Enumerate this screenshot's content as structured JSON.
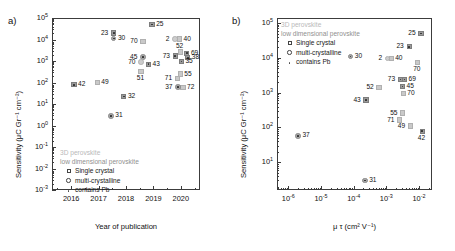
{
  "figure": {
    "panel_a_letter": "a)",
    "panel_b_letter": "b)"
  },
  "legend": {
    "head_3d": "3D perovskite",
    "head_lowdim": "low dimensional perovskite",
    "single_crystal": "Single crystal",
    "multi_crystalline": "multi-crystalline",
    "contains_pb": "contains Pb",
    "sym_square": "square-marker",
    "sym_circle": "circle-marker",
    "sym_dot": "dot-marker"
  },
  "panel_a": {
    "ylabel": "Sensitivity (μC Gr⁻¹ cm⁻²)",
    "xlabel": "Year of publication",
    "yticks": [
      "10⁻³",
      "10⁻²",
      "10⁻¹",
      "10⁰",
      "10¹",
      "10²",
      "10³",
      "10⁴",
      "10⁵"
    ],
    "xticks": [
      "2016",
      "2017",
      "2018",
      "2019",
      "2020"
    ],
    "xlim": [
      2015.3,
      2020.7
    ],
    "ylim_log": [
      -3,
      5
    ]
  },
  "panel_b": {
    "ylabel": "Sensitivity (μC Gr⁻¹ cm⁻²)",
    "xlabel": "μ τ (cm² V⁻¹)",
    "yticks": [
      "10¹",
      "10²",
      "10³",
      "10⁴",
      "10⁵"
    ],
    "xticks": [
      "10⁻⁶",
      "10⁻⁵",
      "10⁻⁴",
      "10⁻³",
      "10⁻²"
    ],
    "xlim_log": [
      -6.35,
      -1.6
    ],
    "ylim_log": [
      0.2,
      5.15
    ]
  },
  "chart_data": [
    {
      "type": "scatter",
      "panel": "a",
      "title": "",
      "xlabel": "Year of publication",
      "ylabel": "Sensitivity (μC Gr⁻¹ cm⁻²)",
      "xscale": "linear",
      "yscale": "log",
      "xlim": [
        2015.3,
        2020.7
      ],
      "ylim": [
        0.001,
        100000
      ],
      "grid": false,
      "legend_position": "lower-left",
      "points": [
        {
          "label": "25",
          "x": 2018.95,
          "y": 50000,
          "marker": "square-dot",
          "label_pos": "right"
        },
        {
          "label": "23",
          "x": 2017.55,
          "y": 20000,
          "marker": "square-dot",
          "label_pos": "left"
        },
        {
          "label": "30",
          "x": 2017.55,
          "y": 11000,
          "marker": "circle-dot",
          "label_pos": "right"
        },
        {
          "label": "70",
          "x": 2018.62,
          "y": 8000,
          "marker": "square",
          "label_pos": "left"
        },
        {
          "label": "2",
          "x": 2019.78,
          "y": 10500,
          "marker": "circle",
          "label_pos": "left"
        },
        {
          "label": "40",
          "x": 2019.95,
          "y": 10500,
          "marker": "square",
          "label_pos": "right"
        },
        {
          "label": "52",
          "x": 2019.98,
          "y": 2600,
          "marker": "square",
          "label_pos": "above"
        },
        {
          "label": "69",
          "x": 2020.22,
          "y": 2300,
          "marker": "square-dot",
          "label_pos": "right"
        },
        {
          "label": "73",
          "x": 2019.8,
          "y": 1700,
          "marker": "square-dot",
          "label_pos": "left"
        },
        {
          "label": "38",
          "x": 2020.25,
          "y": 1400,
          "marker": "square-dot",
          "label_pos": "right"
        },
        {
          "label": "35",
          "x": 2020.02,
          "y": 950,
          "marker": "square-dot",
          "label_pos": "right"
        },
        {
          "label": "45",
          "x": 2018.62,
          "y": 1500,
          "marker": "circle-dot",
          "label_pos": "left"
        },
        {
          "label": "70",
          "x": 2018.55,
          "y": 900,
          "marker": "circle",
          "label_pos": "left"
        },
        {
          "label": "43",
          "x": 2018.82,
          "y": 700,
          "marker": "square-dot",
          "label_pos": "right"
        },
        {
          "label": "51",
          "x": 2018.55,
          "y": 330,
          "marker": "square",
          "label_pos": "below"
        },
        {
          "label": "55",
          "x": 2019.98,
          "y": 250,
          "marker": "square",
          "label_pos": "right"
        },
        {
          "label": "71",
          "x": 2019.88,
          "y": 150,
          "marker": "square",
          "label_pos": "left"
        },
        {
          "label": "72",
          "x": 2020.08,
          "y": 60,
          "marker": "square",
          "label_pos": "right"
        },
        {
          "label": "37",
          "x": 2019.9,
          "y": 60,
          "marker": "circle-dot",
          "label_pos": "left"
        },
        {
          "label": "42",
          "x": 2016.1,
          "y": 78,
          "marker": "square-dot",
          "label_pos": "right"
        },
        {
          "label": "49",
          "x": 2016.95,
          "y": 100,
          "marker": "square",
          "label_pos": "right"
        },
        {
          "label": "32",
          "x": 2017.92,
          "y": 22,
          "marker": "square-dot",
          "label_pos": "right"
        },
        {
          "label": "31",
          "x": 2017.45,
          "y": 2.8,
          "marker": "circle-dot",
          "label_pos": "right"
        }
      ]
    },
    {
      "type": "scatter",
      "panel": "b",
      "title": "",
      "xlabel": "μ τ (cm² V⁻¹)",
      "ylabel": "Sensitivity (μC Gr⁻¹ cm⁻²)",
      "xscale": "log",
      "yscale": "log",
      "xlim": [
        4.5e-07,
        0.025
      ],
      "ylim": [
        1.6,
        140000
      ],
      "grid": false,
      "legend_position": "upper-left",
      "points": [
        {
          "label": "25",
          "x": 0.0115,
          "y": 50000,
          "marker": "square-dot",
          "label_pos": "left"
        },
        {
          "label": "23",
          "x": 0.005,
          "y": 21000,
          "marker": "square-dot",
          "label_pos": "left"
        },
        {
          "label": "30",
          "x": 8e-05,
          "y": 11000,
          "marker": "circle-dot",
          "label_pos": "right"
        },
        {
          "label": "2",
          "x": 0.0011,
          "y": 9500,
          "marker": "circle",
          "label_pos": "left"
        },
        {
          "label": "40",
          "x": 0.0014,
          "y": 9500,
          "marker": "square",
          "label_pos": "right"
        },
        {
          "label": "70",
          "x": 0.009,
          "y": 7500,
          "marker": "square",
          "label_pos": "below"
        },
        {
          "label": "73",
          "x": 0.0027,
          "y": 2400,
          "marker": "square-dot",
          "label_pos": "left"
        },
        {
          "label": "69",
          "x": 0.0036,
          "y": 2400,
          "marker": "square-dot",
          "label_pos": "right"
        },
        {
          "label": "45",
          "x": 0.0031,
          "y": 1500,
          "marker": "square-dot",
          "label_pos": "right"
        },
        {
          "label": "70",
          "x": 0.0033,
          "y": 950,
          "marker": "square",
          "label_pos": "right"
        },
        {
          "label": "52",
          "x": 0.0006,
          "y": 1400,
          "marker": "square",
          "label_pos": "left"
        },
        {
          "label": "43",
          "x": 0.00024,
          "y": 620,
          "marker": "square-dot",
          "label_pos": "left"
        },
        {
          "label": "55",
          "x": 0.0032,
          "y": 260,
          "marker": "square",
          "label_pos": "left"
        },
        {
          "label": "71",
          "x": 0.0026,
          "y": 165,
          "marker": "square",
          "label_pos": "left"
        },
        {
          "label": "49",
          "x": 0.0055,
          "y": 110,
          "marker": "square",
          "label_pos": "left"
        },
        {
          "label": "42",
          "x": 0.0125,
          "y": 78,
          "marker": "square-dot",
          "label_pos": "below"
        },
        {
          "label": "37",
          "x": 2e-06,
          "y": 58,
          "marker": "circle-dot",
          "label_pos": "right"
        },
        {
          "label": "31",
          "x": 0.00022,
          "y": 3.0,
          "marker": "circle-dot",
          "label_pos": "right"
        }
      ]
    }
  ]
}
